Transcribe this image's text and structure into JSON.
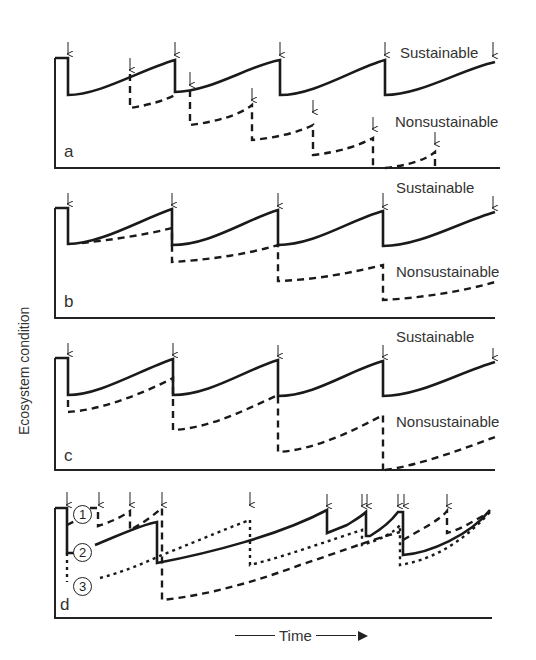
{
  "y_axis_label": "Ecosystem condition",
  "x_axis_label": "Time",
  "panels": [
    {
      "id": "a",
      "letter": "a",
      "sustainable_label": "Sustainable",
      "nonsustainable_label": "Nonsustainable"
    },
    {
      "id": "b",
      "letter": "b",
      "sustainable_label": "Sustainable",
      "nonsustainable_label": "Nonsustainable"
    },
    {
      "id": "c",
      "letter": "c",
      "sustainable_label": "Sustainable",
      "nonsustainable_label": "Nonsustainable"
    },
    {
      "id": "d",
      "letter": "d",
      "scenario_labels": [
        "1",
        "2",
        "3"
      ]
    }
  ],
  "legend": {
    "solid": "Sustainable trajectory",
    "dashed": "Nonsustainable trajectory",
    "dotted": "Scenario 3 trajectory"
  },
  "colors": {
    "line": "#1a1a1a",
    "text": "#333333",
    "background": "#ffffff"
  }
}
